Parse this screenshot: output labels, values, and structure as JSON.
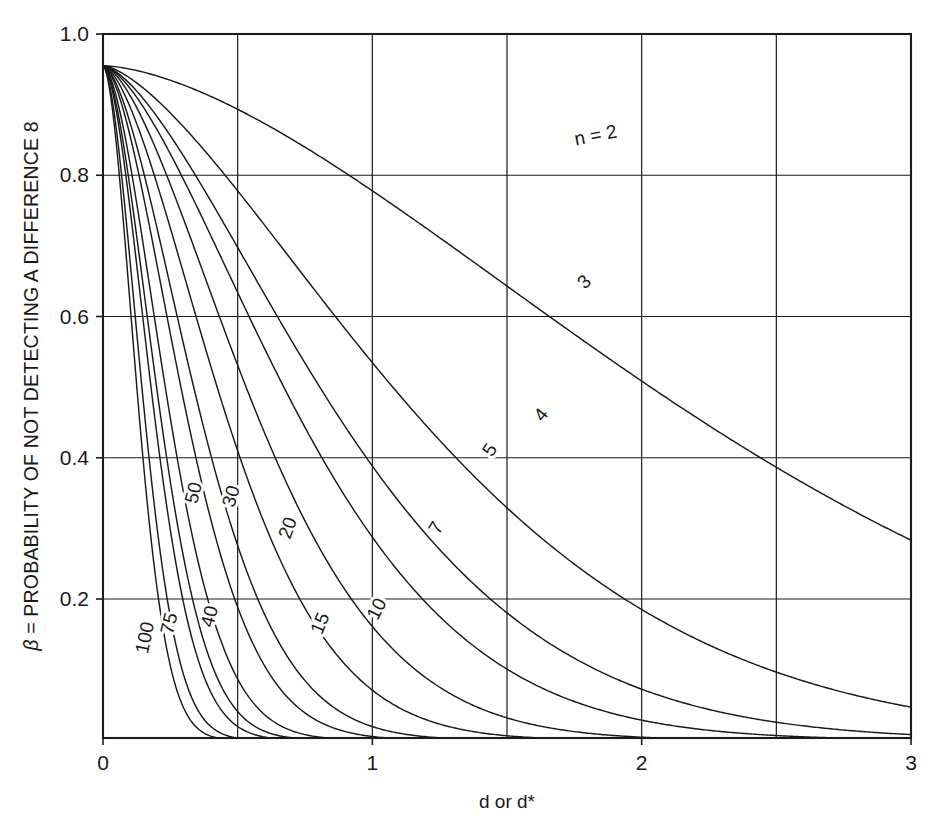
{
  "chart_data": {
    "type": "line",
    "title": "",
    "xlabel": "d or d*",
    "ylabel": "β = PROBABILITY OF NOT DETECTING A DIFFERENCE 8",
    "ylabel_symbol": "β",
    "ylabel_rest": " = PROBABILITY OF NOT DETECTING A DIFFERENCE 8",
    "xlim": [
      0,
      3
    ],
    "ylim": [
      0,
      1
    ],
    "xticks": [
      0,
      1,
      2,
      3
    ],
    "xtick_labels": [
      "0",
      "1",
      "2",
      "3"
    ],
    "yticks": [
      0.2,
      0.4,
      0.6,
      0.8,
      1.0
    ],
    "ytick_labels": [
      "0.2",
      "0.4",
      "0.6",
      "0.8",
      "1.0"
    ],
    "x_gridlines": [
      0,
      0.5,
      1.0,
      1.5,
      2.0,
      2.5,
      3.0
    ],
    "y_gridlines": [
      0.2,
      0.4,
      0.6,
      0.8,
      1.0
    ],
    "grid": true,
    "legend": "inline curve labels",
    "legend_position": "inline",
    "start_beta": 0.955,
    "series": [
      {
        "name": "n = 2",
        "label": "n = 2",
        "label_x": 1.83,
        "label_y": 0.855,
        "label_rotation": -11,
        "k": 0.205,
        "p": 1.62,
        "points": [
          [
            0,
            0.955
          ],
          [
            0.25,
            0.944
          ],
          [
            0.5,
            0.929
          ],
          [
            0.75,
            0.912
          ],
          [
            1,
            0.892
          ],
          [
            1.25,
            0.87
          ],
          [
            1.5,
            0.848
          ],
          [
            1.75,
            0.825
          ],
          [
            2,
            0.8
          ],
          [
            2.25,
            0.777
          ],
          [
            2.5,
            0.774
          ],
          [
            2.75,
            0.752
          ],
          [
            3,
            0.726
          ]
        ]
      },
      {
        "name": "3",
        "label": "3",
        "label_x": 1.79,
        "label_y": 0.648,
        "label_rotation": -44,
        "k": 0.58,
        "p": 1.5,
        "points": [
          [
            0,
            0.955
          ],
          [
            0.25,
            0.925
          ],
          [
            0.5,
            0.886
          ],
          [
            0.75,
            0.838
          ],
          [
            1,
            0.784
          ],
          [
            1.25,
            0.723
          ],
          [
            1.5,
            0.66
          ],
          [
            1.75,
            0.594
          ],
          [
            2,
            0.53
          ],
          [
            2.25,
            0.466
          ],
          [
            2.5,
            0.405
          ],
          [
            2.75,
            0.33
          ],
          [
            3,
            0.266
          ]
        ]
      },
      {
        "name": "4",
        "label": "4",
        "label_x": 1.63,
        "label_y": 0.46,
        "label_rotation": -52,
        "k": 0.9,
        "p": 1.52,
        "points": [
          [
            0,
            0.955
          ],
          [
            0.25,
            0.912
          ],
          [
            0.5,
            0.852
          ],
          [
            0.75,
            0.781
          ],
          [
            1,
            0.703
          ],
          [
            1.25,
            0.62
          ],
          [
            1.5,
            0.536
          ],
          [
            1.75,
            0.452
          ],
          [
            2,
            0.375
          ],
          [
            2.25,
            0.3
          ],
          [
            2.5,
            0.235
          ],
          [
            2.75,
            0.175
          ],
          [
            3,
            0.12
          ]
        ]
      },
      {
        "name": "5",
        "label": "5",
        "label_x": 1.44,
        "label_y": 0.41,
        "label_rotation": -56,
        "k": 1.2,
        "p": 1.55,
        "points": [
          [
            0,
            0.955
          ],
          [
            0.25,
            0.9
          ],
          [
            0.5,
            0.824
          ],
          [
            0.75,
            0.735
          ],
          [
            1,
            0.64
          ],
          [
            1.25,
            0.544
          ],
          [
            1.5,
            0.45
          ],
          [
            1.75,
            0.362
          ],
          [
            2,
            0.283
          ],
          [
            2.25,
            0.212
          ],
          [
            2.5,
            0.152
          ],
          [
            2.75,
            0.103
          ],
          [
            3,
            0.065
          ]
        ]
      },
      {
        "name": "7",
        "label": "7",
        "label_x": 1.24,
        "label_y": 0.3,
        "label_rotation": -60,
        "k": 1.78,
        "p": 1.6,
        "points": [
          [
            0,
            0.955
          ],
          [
            0.25,
            0.878
          ],
          [
            0.5,
            0.772
          ],
          [
            0.75,
            0.65
          ],
          [
            1,
            0.527
          ],
          [
            1.25,
            0.41
          ],
          [
            1.5,
            0.305
          ],
          [
            1.75,
            0.216
          ],
          [
            2,
            0.145
          ],
          [
            2.25,
            0.09
          ],
          [
            2.5,
            0.052
          ],
          [
            2.75,
            0.028
          ],
          [
            3,
            0.014
          ]
        ]
      },
      {
        "name": "10",
        "label": "10",
        "label_x": 1.02,
        "label_y": 0.185,
        "label_rotation": -63,
        "k": 2.6,
        "p": 1.62,
        "points": [
          [
            0,
            0.955
          ],
          [
            0.25,
            0.848
          ],
          [
            0.5,
            0.705
          ],
          [
            0.75,
            0.55
          ],
          [
            1,
            0.4
          ],
          [
            1.25,
            0.27
          ],
          [
            1.5,
            0.168
          ],
          [
            1.75,
            0.095
          ],
          [
            2,
            0.05
          ],
          [
            2.25,
            0.023
          ],
          [
            2.5,
            0.01
          ],
          [
            2.75,
            0.004
          ],
          [
            3,
            0.0015
          ]
        ]
      },
      {
        "name": "15",
        "label": "15",
        "label_x": 0.81,
        "label_y": 0.165,
        "label_rotation": -67,
        "k": 3.9,
        "p": 1.65,
        "points": [
          [
            0,
            0.955
          ],
          [
            0.25,
            0.805
          ],
          [
            0.5,
            0.61
          ],
          [
            0.75,
            0.425
          ],
          [
            1,
            0.262
          ],
          [
            1.25,
            0.142
          ],
          [
            1.5,
            0.067
          ],
          [
            1.75,
            0.027
          ],
          [
            2,
            0.009
          ],
          [
            2.25,
            0.003
          ],
          [
            2.5,
            0.001
          ],
          [
            2.75,
            0.0004
          ],
          [
            3,
            0.0001
          ]
        ]
      },
      {
        "name": "20",
        "label": "20",
        "label_x": 0.69,
        "label_y": 0.3,
        "label_rotation": -70,
        "k": 5.2,
        "p": 1.68,
        "points": [
          [
            0,
            0.955
          ],
          [
            0.25,
            0.765
          ],
          [
            0.5,
            0.53
          ],
          [
            0.75,
            0.325
          ],
          [
            1,
            0.17
          ],
          [
            1.25,
            0.073
          ],
          [
            1.5,
            0.025
          ],
          [
            1.75,
            0.007
          ],
          [
            2,
            0.0015
          ],
          [
            2.25,
            0.0003
          ],
          [
            2.5,
            0.0001
          ],
          [
            2.75,
            0
          ],
          [
            3,
            0
          ]
        ]
      },
      {
        "name": "30",
        "label": "30",
        "label_x": 0.48,
        "label_y": 0.345,
        "label_rotation": -73,
        "k": 7.8,
        "p": 1.7,
        "points": [
          [
            0,
            0.955
          ],
          [
            0.2,
            0.755
          ],
          [
            0.35,
            0.575
          ],
          [
            0.5,
            0.4
          ],
          [
            0.65,
            0.25
          ],
          [
            0.8,
            0.135
          ],
          [
            1,
            0.05
          ],
          [
            1.2,
            0.014
          ],
          [
            1.4,
            0.003
          ],
          [
            1.6,
            0.0005
          ],
          [
            2,
            0
          ],
          [
            2.5,
            0
          ],
          [
            3,
            0
          ]
        ]
      },
      {
        "name": "40",
        "label": "40",
        "label_x": 0.4,
        "label_y": 0.175,
        "label_rotation": -75,
        "k": 10.4,
        "p": 1.72,
        "points": [
          [
            0,
            0.955
          ],
          [
            0.15,
            0.805
          ],
          [
            0.3,
            0.6
          ],
          [
            0.45,
            0.39
          ],
          [
            0.6,
            0.22
          ],
          [
            0.75,
            0.105
          ],
          [
            0.9,
            0.042
          ],
          [
            1.1,
            0.009
          ],
          [
            1.3,
            0.0015
          ],
          [
            1.6,
            0
          ],
          [
            2,
            0
          ],
          [
            2.5,
            0
          ],
          [
            3,
            0
          ]
        ]
      },
      {
        "name": "50",
        "label": "50",
        "label_x": 0.34,
        "label_y": 0.35,
        "label_rotation": -76,
        "k": 13,
        "p": 1.74,
        "points": [
          [
            0,
            0.955
          ],
          [
            0.15,
            0.76
          ],
          [
            0.27,
            0.585
          ],
          [
            0.4,
            0.385
          ],
          [
            0.53,
            0.215
          ],
          [
            0.66,
            0.105
          ],
          [
            0.8,
            0.04
          ],
          [
            1,
            0.008
          ],
          [
            1.2,
            0.0012
          ],
          [
            1.5,
            0
          ],
          [
            2,
            0
          ],
          [
            2.5,
            0
          ],
          [
            3,
            0
          ]
        ]
      },
      {
        "name": "75",
        "label": "75",
        "label_x": 0.25,
        "label_y": 0.165,
        "label_rotation": -77,
        "k": 19.5,
        "p": 1.76,
        "points": [
          [
            0,
            0.955
          ],
          [
            0.1,
            0.83
          ],
          [
            0.2,
            0.64
          ],
          [
            0.3,
            0.41
          ],
          [
            0.4,
            0.22
          ],
          [
            0.5,
            0.1
          ],
          [
            0.62,
            0.032
          ],
          [
            0.78,
            0.006
          ],
          [
            0.95,
            0.001
          ],
          [
            1.2,
            0
          ],
          [
            1.6,
            0
          ],
          [
            2.2,
            0
          ],
          [
            3,
            0
          ]
        ]
      },
      {
        "name": "100",
        "label": "100",
        "label_x": 0.16,
        "label_y": 0.145,
        "label_rotation": -78,
        "k": 26,
        "p": 1.78,
        "points": [
          [
            0,
            0.955
          ],
          [
            0.08,
            0.845
          ],
          [
            0.16,
            0.66
          ],
          [
            0.25,
            0.43
          ],
          [
            0.34,
            0.24
          ],
          [
            0.43,
            0.115
          ],
          [
            0.54,
            0.038
          ],
          [
            0.68,
            0.008
          ],
          [
            0.84,
            0.0012
          ],
          [
            1.05,
            0
          ],
          [
            1.4,
            0
          ],
          [
            2,
            0
          ],
          [
            3,
            0
          ]
        ]
      }
    ]
  },
  "figure": {
    "background_color": "#ffffff",
    "line_color": "#1a1a1a"
  }
}
